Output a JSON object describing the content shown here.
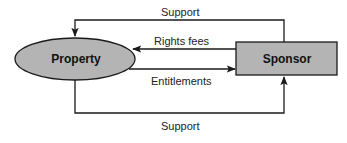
{
  "diagram": {
    "nodes": [
      {
        "id": "property",
        "label": "Property",
        "shape": "ellipse"
      },
      {
        "id": "sponsor",
        "label": "Sponsor",
        "shape": "rectangle"
      }
    ],
    "edges": [
      {
        "id": "support_top",
        "label": "Support",
        "from": "sponsor",
        "to": "property"
      },
      {
        "id": "rights_fees",
        "label": "Rights fees",
        "from": "sponsor",
        "to": "property"
      },
      {
        "id": "entitlements",
        "label": "Entitlements",
        "from": "property",
        "to": "sponsor"
      },
      {
        "id": "support_bottom",
        "label": "Support",
        "from": "property",
        "to": "sponsor"
      }
    ]
  },
  "colors": {
    "node_fill": "#b4b4b4",
    "stroke": "#1a1a1a",
    "background": "#ffffff"
  }
}
